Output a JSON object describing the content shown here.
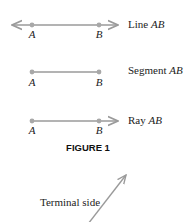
{
  "colors": {
    "line": "#9a9a9a",
    "point": "#a8a8a8",
    "text": "#222222"
  },
  "figures": {
    "line": {
      "label_prefix": "Line ",
      "label_name": "AB",
      "points": [
        "A",
        "B"
      ]
    },
    "segment": {
      "label_prefix": "Segment ",
      "label_name": "AB",
      "points": [
        "A",
        "B"
      ]
    },
    "ray": {
      "label_prefix": "Ray ",
      "label_name": "AB",
      "points": [
        "A",
        "B"
      ]
    }
  },
  "caption": "FIGURE 1",
  "angle": {
    "terminal_label": "Terminal side"
  }
}
